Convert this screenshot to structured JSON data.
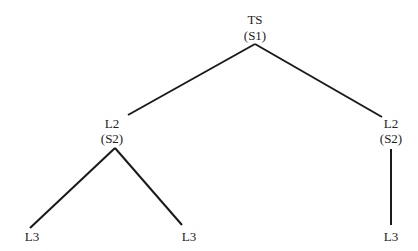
{
  "diagram": {
    "type": "tree",
    "nodes": [
      {
        "id": "root",
        "label": "TS",
        "sublabel": "(S1)"
      },
      {
        "id": "left-l2",
        "label": "L2",
        "sublabel": "(S2)"
      },
      {
        "id": "right-l2",
        "label": "L2",
        "sublabel": "(S2)"
      },
      {
        "id": "left-l3-a",
        "label": "L3"
      },
      {
        "id": "left-l3-b",
        "label": "L3"
      },
      {
        "id": "right-l3",
        "label": "L3"
      }
    ],
    "edges": [
      [
        "root",
        "left-l2"
      ],
      [
        "root",
        "right-l2"
      ],
      [
        "left-l2",
        "left-l3-a"
      ],
      [
        "left-l2",
        "left-l3-b"
      ],
      [
        "right-l2",
        "right-l3"
      ]
    ],
    "line_color": "#1a1a1a"
  }
}
